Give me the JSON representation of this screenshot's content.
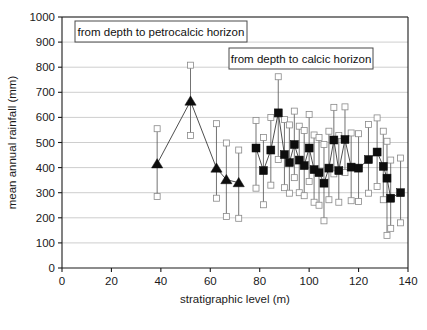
{
  "chart_data": {
    "type": "scatter",
    "title": "",
    "xlabel": "stratigraphic level (m)",
    "ylabel": "mean annual rainfall (mm)",
    "xlim": [
      0,
      140
    ],
    "ylim": [
      0,
      1000
    ],
    "xticks": [
      0,
      20,
      40,
      60,
      80,
      100,
      120,
      140
    ],
    "yticks": [
      0,
      100,
      200,
      300,
      400,
      500,
      600,
      700,
      800,
      900,
      1000
    ],
    "grid": "horizontal",
    "legend_position": "inside-top",
    "annotations": [
      "from depth to petrocalcic horizon",
      "from depth to calcic horizon"
    ],
    "series": [
      {
        "name": "from depth to petrocalcic horizon",
        "marker": "triangle",
        "marker_color": "#0d0d0d",
        "connected": true,
        "error_cap": "open-square",
        "points": [
          {
            "x": 38.5,
            "y": 415,
            "low": 285,
            "high": 555
          },
          {
            "x": 52.0,
            "y": 665,
            "low": 528,
            "high": 808
          },
          {
            "x": 62.5,
            "y": 398,
            "low": 278,
            "high": 575
          },
          {
            "x": 66.5,
            "y": 352,
            "low": 205,
            "high": 498
          },
          {
            "x": 71.5,
            "y": 340,
            "low": 198,
            "high": 470
          }
        ]
      },
      {
        "name": "from depth to calcic horizon",
        "marker": "square",
        "marker_color": "#0d0d0d",
        "connected": true,
        "error_cap": "open-square",
        "points": [
          {
            "x": 78.5,
            "y": 478,
            "low": 318,
            "high": 588
          },
          {
            "x": 81.5,
            "y": 388,
            "low": 252,
            "high": 520
          },
          {
            "x": 84.5,
            "y": 470,
            "low": 330,
            "high": 600
          },
          {
            "x": 87.5,
            "y": 618,
            "low": 432,
            "high": 762
          },
          {
            "x": 90.0,
            "y": 452,
            "low": 320,
            "high": 592
          },
          {
            "x": 92.0,
            "y": 420,
            "low": 298,
            "high": 570
          },
          {
            "x": 94.0,
            "y": 492,
            "low": 360,
            "high": 625
          },
          {
            "x": 96.0,
            "y": 430,
            "low": 300,
            "high": 565
          },
          {
            "x": 98.0,
            "y": 408,
            "low": 288,
            "high": 548
          },
          {
            "x": 100.0,
            "y": 478,
            "low": 345,
            "high": 612
          },
          {
            "x": 102.0,
            "y": 392,
            "low": 262,
            "high": 530
          },
          {
            "x": 104.0,
            "y": 380,
            "low": 250,
            "high": 520
          },
          {
            "x": 106.0,
            "y": 338,
            "low": 188,
            "high": 492
          },
          {
            "x": 108.0,
            "y": 398,
            "low": 272,
            "high": 545
          },
          {
            "x": 110.0,
            "y": 510,
            "low": 375,
            "high": 640
          },
          {
            "x": 112.0,
            "y": 388,
            "low": 262,
            "high": 528
          },
          {
            "x": 114.5,
            "y": 512,
            "low": 380,
            "high": 642
          },
          {
            "x": 117.0,
            "y": 402,
            "low": 268,
            "high": 538
          },
          {
            "x": 120.0,
            "y": 398,
            "low": 265,
            "high": 535
          },
          {
            "x": 124.0,
            "y": 432,
            "low": 298,
            "high": 572
          },
          {
            "x": 127.5,
            "y": 462,
            "low": 325,
            "high": 598
          },
          {
            "x": 130.0,
            "y": 405,
            "low": 272,
            "high": 545
          },
          {
            "x": 131.5,
            "y": 358,
            "low": 130,
            "high": 505
          },
          {
            "x": 133.0,
            "y": 278,
            "low": 158,
            "high": 430
          },
          {
            "x": 137.0,
            "y": 300,
            "low": 180,
            "high": 438
          }
        ]
      }
    ]
  }
}
